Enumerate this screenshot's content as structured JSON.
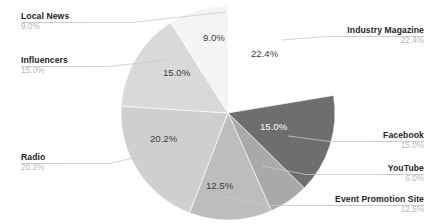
{
  "chart_data": {
    "type": "pie",
    "title": "",
    "subtitle": "",
    "xlabel": "",
    "ylabel": "",
    "legend_position": "callout-labels",
    "grid": false,
    "categories": [
      "Industry Magazine",
      "Facebook",
      "YouTube",
      "Event Promotion Site",
      "Radio",
      "Influencers",
      "Local News"
    ],
    "values": [
      22.4,
      15.0,
      6.0,
      12.5,
      20.2,
      15.0,
      9.0
    ],
    "value_labels": [
      "22.4%",
      "15.0%",
      "6.0%",
      "12.5%",
      "20.2%",
      "15.0%",
      "9.0%"
    ],
    "colors": [
      "#ffffff",
      "#6e6e6e",
      "#a9a9a9",
      "#bdbdbd",
      "#cfcfcf",
      "#d9d9d9",
      "#f4f4f4"
    ],
    "slices": [
      {
        "name": "Industry Magazine",
        "value": 22.4,
        "value_label": "22.4%",
        "color": "#ffffff",
        "exploded": true,
        "label_side": "right",
        "slice_label_color": "dark"
      },
      {
        "name": "Facebook",
        "value": 15.0,
        "value_label": "15.0%",
        "color": "#6e6e6e",
        "exploded": false,
        "label_side": "right",
        "slice_label_color": "light"
      },
      {
        "name": "YouTube",
        "value": 6.0,
        "value_label": "6.0%",
        "color": "#a9a9a9",
        "exploded": false,
        "label_side": "right",
        "slice_label_color": "dark"
      },
      {
        "name": "Event Promotion Site",
        "value": 12.5,
        "value_label": "12.5%",
        "color": "#bdbdbd",
        "exploded": false,
        "label_side": "right",
        "slice_label_color": "dark"
      },
      {
        "name": "Radio",
        "value": 20.2,
        "value_label": "20.2%",
        "color": "#cfcfcf",
        "exploded": false,
        "label_side": "left",
        "slice_label_color": "dark"
      },
      {
        "name": "Influencers",
        "value": 15.0,
        "value_label": "15.0%",
        "color": "#d9d9d9",
        "exploded": false,
        "label_side": "left",
        "slice_label_color": "dark"
      },
      {
        "name": "Local News",
        "value": 9.0,
        "value_label": "9.0%",
        "color": "#f4f4f4",
        "exploded": false,
        "label_side": "left",
        "slice_label_color": "dark"
      }
    ]
  },
  "callouts": {
    "local_news": {
      "name": "Local News",
      "value": "9.0%"
    },
    "influencers": {
      "name": "Influencers",
      "value": "15.0%"
    },
    "radio": {
      "name": "Radio",
      "value": "20.2%"
    },
    "industry_magazine": {
      "name": "Industry Magazine",
      "value": "22.4%"
    },
    "facebook": {
      "name": "Facebook",
      "value": "15.0%"
    },
    "youtube": {
      "name": "YouTube",
      "value": "6.0%"
    },
    "event_promotion_site": {
      "name": "Event Promotion Site",
      "value": "12.5%"
    }
  },
  "slice_values": {
    "industry_magazine": "22.4%",
    "facebook": "15.0%",
    "youtube": "6.0%",
    "event_promotion_site": "12.5%",
    "radio": "20.2%",
    "influencers": "15.0%",
    "local_news": "9.0%"
  },
  "style": {
    "background": "#ffffff",
    "leader_line_color": "#c9c9c9",
    "label_title_color": "#231f20",
    "label_value_color": "#b7b7b7"
  }
}
